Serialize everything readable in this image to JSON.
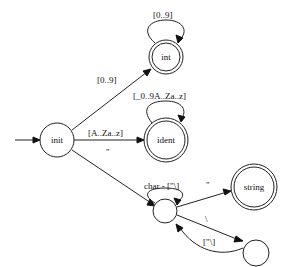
{
  "diagram": {
    "type": "finite-state-automaton",
    "colors": {
      "stroke": "#222222",
      "background": "#ffffff",
      "text": "#111111"
    },
    "states": {
      "init": {
        "label": "init",
        "accepting": false,
        "start": true
      },
      "int": {
        "label": "int",
        "accepting": true
      },
      "ident": {
        "label": "ident",
        "accepting": true
      },
      "instr": {
        "label": "",
        "accepting": false
      },
      "string": {
        "label": "string",
        "accepting": true
      },
      "escape": {
        "label": "",
        "accepting": false
      }
    },
    "transitions": {
      "init_to_int": {
        "from": "init",
        "to": "int",
        "label": "[0..9]"
      },
      "int_loop": {
        "from": "int",
        "to": "int",
        "label": "[0..9]"
      },
      "init_to_ident": {
        "from": "init",
        "to": "ident",
        "label": "[A..Za..z]"
      },
      "ident_loop": {
        "from": "ident",
        "to": "ident",
        "label": "[_0..9A..Za..z]"
      },
      "init_to_instr": {
        "from": "init",
        "to": "instr",
        "label": "\""
      },
      "instr_loop": {
        "from": "instr",
        "to": "instr",
        "label": "char - [\"\\]"
      },
      "instr_to_string": {
        "from": "instr",
        "to": "string",
        "label": "\""
      },
      "instr_to_escape": {
        "from": "instr",
        "to": "escape",
        "label": "\\"
      },
      "escape_to_instr": {
        "from": "escape",
        "to": "instr",
        "label": "[\"\\]"
      }
    }
  }
}
